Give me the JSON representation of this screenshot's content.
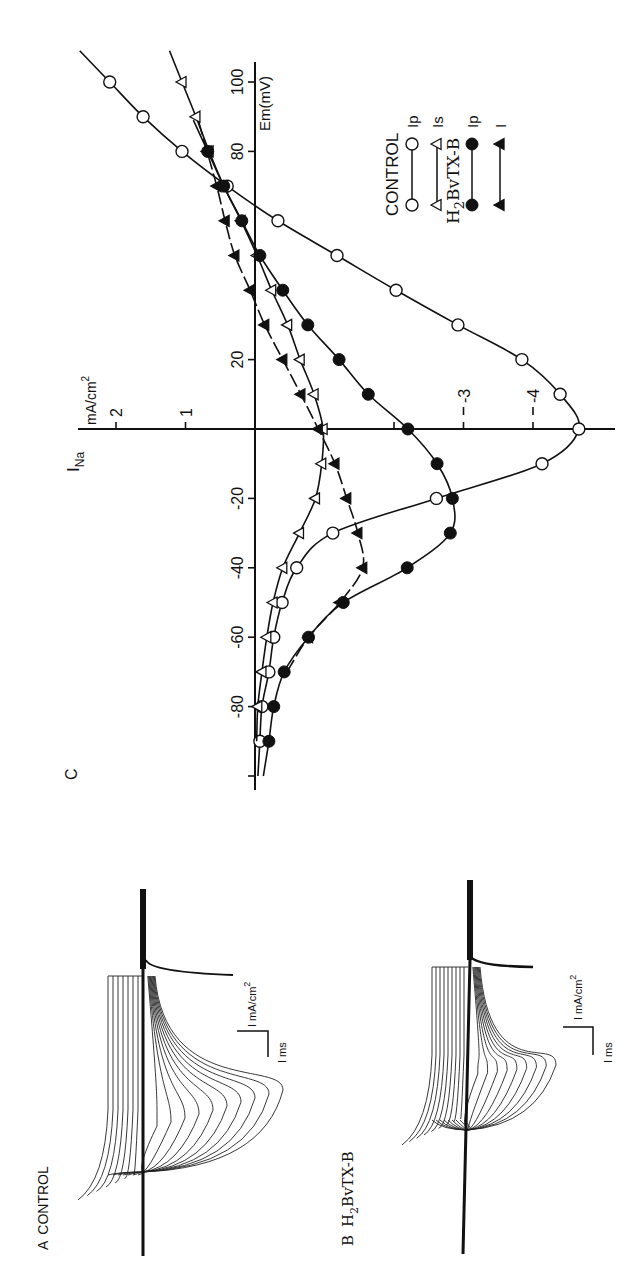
{
  "figure": {
    "panel_a": {
      "letter": "A",
      "title": "CONTROL",
      "scale_current": "I mA/cm",
      "scale_current_sup": "2",
      "scale_time": "I ms"
    },
    "panel_b": {
      "letter": "B",
      "title_h": "H",
      "title_sub": "2",
      "title_rest": "BvTX-B",
      "scale_current": "I mA/cm",
      "scale_current_sup": "2",
      "scale_time": "I ms"
    },
    "panel_c": {
      "letter": "C",
      "y_label_main": "I",
      "y_label_sub": "Na",
      "y_units": "mA/cm",
      "y_units_sup": "2",
      "x_label": "Em(mV)",
      "legend": {
        "group1": "CONTROL",
        "group2_h": "H",
        "group2_sub": "2",
        "group2_rest": "BvTX-B",
        "items": [
          {
            "label": "Ip",
            "marker": "open-circle"
          },
          {
            "label": "Is",
            "marker": "open-triangle"
          },
          {
            "label": "Ip",
            "marker": "filled-circle"
          },
          {
            "label": "I",
            "marker": "filled-triangle"
          }
        ]
      }
    }
  },
  "chart_data": [
    {
      "type": "line",
      "title": "C: Peak and steady-state Na current vs membrane potential",
      "xlabel": "Em (mV)",
      "ylabel": "I_Na (mA/cm²)",
      "x_ticks": [
        -100,
        -80,
        -60,
        -40,
        -20,
        0,
        20,
        80,
        100
      ],
      "x_tick_labels": [
        "",
        "-80",
        "-60",
        "-40",
        "-20",
        "",
        "20",
        "80",
        "100"
      ],
      "y_ticks": [
        2,
        1,
        -2,
        -3,
        -4
      ],
      "y_tick_labels": [
        "2",
        "1",
        "",
        "-3",
        "-4"
      ],
      "xlim": [
        -100,
        100
      ],
      "ylim": [
        -5,
        2.5
      ],
      "grid": false,
      "legend_position": "upper right (rotated)",
      "orientation": "figure rotated 90° counter-clockwise",
      "series": [
        {
          "name": "CONTROL Ip",
          "marker": "open-circle",
          "x": [
            -90,
            -80,
            -70,
            -60,
            -50,
            -40,
            -30,
            -20,
            -10,
            0,
            10,
            20,
            30,
            40,
            50,
            60,
            70,
            80,
            90,
            100
          ],
          "y": [
            -0.07,
            -0.1,
            -0.2,
            -0.27,
            -0.39,
            -0.6,
            -1.12,
            -2.61,
            -4.13,
            -4.66,
            -4.39,
            -3.84,
            -2.92,
            -2.03,
            -1.18,
            -0.33,
            0.4,
            1.05,
            1.61,
            2.09
          ]
        },
        {
          "name": "CONTROL Is",
          "marker": "open-triangle",
          "x": [
            -80,
            -70,
            -60,
            -50,
            -40,
            -30,
            -20,
            -10,
            0,
            10,
            20,
            30,
            40,
            50,
            60,
            70,
            80,
            90,
            100
          ],
          "y": [
            -0.04,
            -0.1,
            -0.17,
            -0.26,
            -0.4,
            -0.64,
            -0.87,
            -0.96,
            -0.98,
            -0.85,
            -0.65,
            -0.47,
            -0.24,
            -0.03,
            0.2,
            0.45,
            0.66,
            0.85,
            1.05
          ]
        },
        {
          "name": "H2BvTX-B Ip",
          "marker": "filled-circle",
          "x": [
            -90,
            -80,
            -70,
            -60,
            -50,
            -40,
            -30,
            -20,
            -10,
            0,
            10,
            20,
            30,
            40,
            50,
            60,
            70,
            80
          ],
          "y": [
            -0.2,
            -0.27,
            -0.42,
            -0.77,
            -1.27,
            -2.19,
            -2.81,
            -2.84,
            -2.62,
            -2.2,
            -1.63,
            -1.21,
            -0.76,
            -0.4,
            -0.07,
            0.19,
            0.45,
            0.68
          ]
        },
        {
          "name": "H2BvTX-B I",
          "marker": "filled-triangle",
          "x": [
            -60,
            -50,
            -40,
            -30,
            -20,
            -10,
            0,
            10,
            20,
            30,
            40,
            50,
            60,
            70,
            80
          ],
          "y": [
            -0.77,
            -1.22,
            -1.55,
            -1.48,
            -1.32,
            -1.15,
            -0.91,
            -0.66,
            -0.4,
            -0.14,
            0.07,
            0.29,
            0.43,
            0.55,
            0.69
          ]
        }
      ]
    }
  ],
  "traces": {
    "panel_a": {
      "left_count": 7,
      "right_count": 10
    },
    "panel_b": {
      "left_count": 9,
      "right_count": 9
    }
  }
}
